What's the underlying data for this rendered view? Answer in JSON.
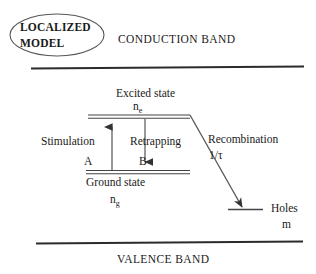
{
  "figure": {
    "badge": {
      "line1": "LOCALIZED",
      "line2": "MODEL"
    },
    "bands": {
      "conduction": "CONDUCTION BAND",
      "valence": "VALENCE BAND"
    },
    "levels": {
      "excited_state_label": "Excited state",
      "excited_state_symbol": "n",
      "excited_state_symbol_sub": "e",
      "ground_state_label": "Ground state",
      "ground_state_symbol": "n",
      "ground_state_symbol_sub": "g",
      "holes_label": "Holes",
      "holes_symbol": "m"
    },
    "processes": {
      "stimulation_label": "Stimulation",
      "stimulation_rate": "A",
      "retrapping_label": "Retrapping",
      "retrapping_rate": "B",
      "recombination_label": "Recombination",
      "recombination_rate": "1/τ"
    },
    "colors": {
      "ink": "#1a1a1a",
      "line": "#333333",
      "background": "#ffffff"
    }
  }
}
